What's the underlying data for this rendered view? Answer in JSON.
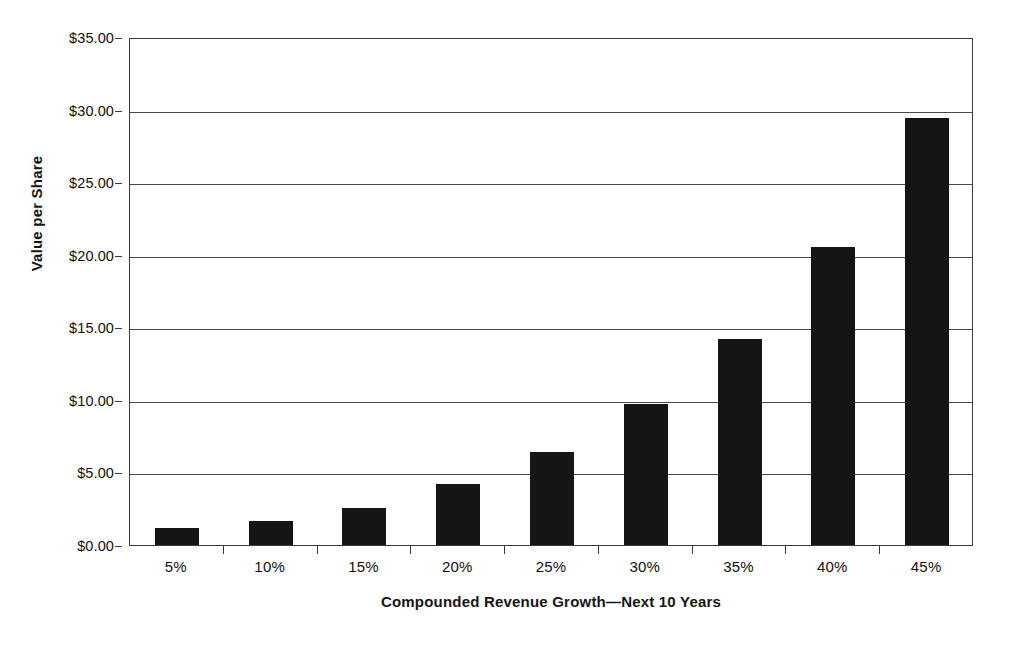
{
  "chart_data": {
    "type": "bar",
    "title": "",
    "xlabel": "Compounded Revenue Growth—Next 10 Years",
    "ylabel": "Value per Share",
    "categories": [
      "5%",
      "10%",
      "15%",
      "20%",
      "25%",
      "30%",
      "35%",
      "40%",
      "45%"
    ],
    "values": [
      1.2,
      1.65,
      2.55,
      4.2,
      6.4,
      9.7,
      14.2,
      20.55,
      29.4
    ],
    "ylim": [
      0,
      35
    ],
    "ytick_step": 5,
    "ytick_values": [
      0,
      5,
      10,
      15,
      20,
      25,
      30,
      35
    ],
    "ytick_labels": [
      "$0.00",
      "$5.00",
      "$10.00",
      "$15.00",
      "$20.00",
      "$25.00",
      "$30.00",
      "$35.00"
    ],
    "grid": "horizontal",
    "legend": "none",
    "bar_color": "#151515",
    "axis_color": "#3c3c3c",
    "gridline_color": "#4a4a4a",
    "background_color": "#ffffff"
  }
}
